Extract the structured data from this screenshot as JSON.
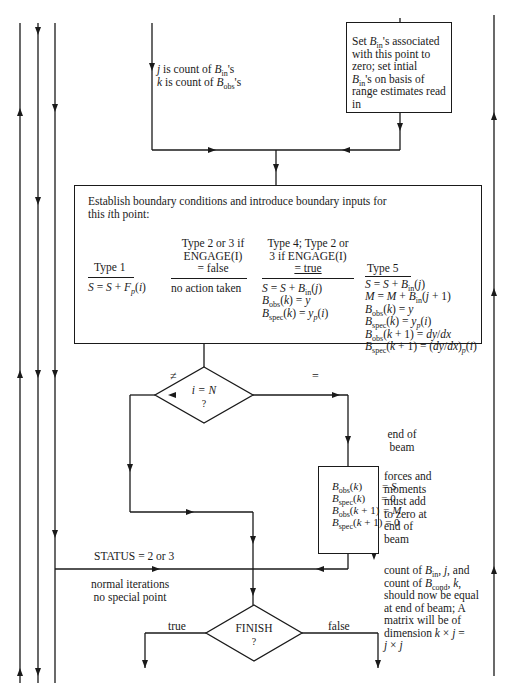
{
  "diagram": {
    "type": "flowchart",
    "top_note": {
      "line1_var": "j",
      "line1_text": " is count of ",
      "line1_sym": "B",
      "line1_sub": "in",
      "line1_tail": "'s",
      "line2_var": "k",
      "line2_text": " is count of ",
      "line2_sym": "B",
      "line2_sub": "obs",
      "line2_tail": "'s"
    },
    "init_box": {
      "l1_pre": "Set ",
      "l1_sym": "B",
      "l1_sub": "in",
      "l1_post": "'s associated",
      "l2": "with this point to",
      "l3": "zero; set intial",
      "l4_sym": "B",
      "l4_sub": "in",
      "l4_post": "'s on basis of",
      "l5": "range estimates read",
      "l6": "in"
    },
    "main_box": {
      "title_line1": "Establish boundary conditions and introduce boundary inputs for",
      "title_line2_pre": "this ",
      "title_line2_var": "i",
      "title_line2_post": "th point:",
      "columns": [
        {
          "header": [
            "Type 1"
          ],
          "body": [
            "S = S + F_p(i)"
          ]
        },
        {
          "header": [
            "Type 2 or 3 if",
            "ENGAGE(I)",
            "= false"
          ],
          "body": [
            "no action taken"
          ]
        },
        {
          "header": [
            "Type 4; Type 2 or",
            "3 if ENGAGE(I)",
            "= true"
          ],
          "body": [
            "S = S + B_in(j)",
            "B_obs(k) = y",
            "B_spec(k) = y_p(i)"
          ]
        },
        {
          "header": [
            "Type 5"
          ],
          "body": [
            "S = S + B_in(j)",
            "M = M + B_in(j + 1)",
            "B_obs(k) = y",
            "B_spec(k) = y_p(i)",
            "B_obs(k + 1) = dy/dx",
            "B_spec(k + 1) = (dy/dx)_p(i)"
          ]
        }
      ]
    },
    "decision_iN": {
      "line1": "i = N",
      "line2": "?",
      "branch_left": "≠",
      "branch_right": "="
    },
    "end_of_beam_label": [
      "end of",
      "beam"
    ],
    "end_box": {
      "rows": [
        {
          "lhs": "B_obs(k)",
          "rhs": "= S"
        },
        {
          "lhs": "B_spec(k)",
          "rhs": "= 0"
        },
        {
          "lhs": "B_obs(k + 1)",
          "rhs": "= M"
        },
        {
          "lhs": "B_spec(k + 1)",
          "rhs": "= 0"
        }
      ]
    },
    "end_box_note": [
      "forces and",
      "moments",
      "must add",
      "to zero at",
      "end of",
      "beam"
    ],
    "status_label": "STATUS = 2 or 3",
    "normal_label": [
      "normal iterations",
      "no special point"
    ],
    "count_note": [
      "count of B_in, j, and",
      "count of B_cond, k,",
      "should now be equal",
      "at end of beam; A",
      "matrix will be of",
      "dimension k × j =",
      "j × j"
    ],
    "decision_finish": {
      "line1": "FINISH",
      "line2": "?",
      "branch_left": "true",
      "branch_right": "false"
    }
  }
}
